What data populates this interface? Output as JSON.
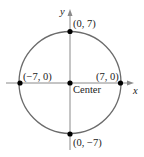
{
  "diagram": {
    "type": "circle-on-coordinate-plane",
    "center_label": "Center",
    "radius": 7,
    "axes": {
      "x_label": "x",
      "y_label": "y"
    },
    "points": [
      {
        "name": "top",
        "label": "(0, 7)"
      },
      {
        "name": "left",
        "label": "(−7, 0)"
      },
      {
        "name": "right",
        "label": "(7, 0)"
      },
      {
        "name": "bottom",
        "label": "(0, −7)"
      },
      {
        "name": "center",
        "label": "Center"
      }
    ],
    "colors": {
      "circle": "#6b6b6b",
      "axes": "#8a8a8a",
      "points": "#000000"
    }
  }
}
